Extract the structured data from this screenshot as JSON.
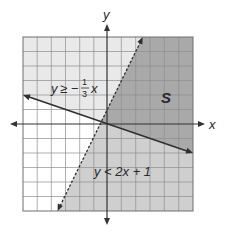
{
  "figure": {
    "axes": {
      "x_label": "x",
      "y_label": "y",
      "x_range": [
        -6,
        6
      ],
      "y_range": [
        -6,
        6
      ],
      "grid": true
    },
    "inequalities": [
      {
        "id": "solid",
        "label_y": "y",
        "label_op": "≥",
        "label_rhs_prefix": "−",
        "label_frac_num": "1",
        "label_frac_den": "3",
        "label_var": "x",
        "expression": "y ≥ −(1/3)x",
        "line_style": "solid"
      },
      {
        "id": "dashed",
        "label": "y < 2x + 1",
        "expression": "y < 2x + 1",
        "line_style": "dashed"
      }
    ],
    "solution_region_label": "S",
    "colors": {
      "solution_region": "#a9a9a9",
      "region_y_ge": "#e9e9e9",
      "region_y_lt": "#cfcfcf",
      "neither": "#ffffff",
      "grid_line": "#8e8e8e",
      "axis_line": "#333333"
    }
  }
}
